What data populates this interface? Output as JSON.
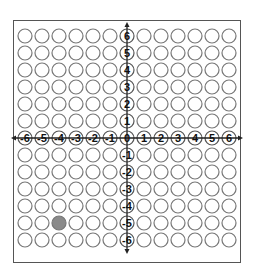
{
  "grid": {
    "x_min": -6,
    "x_max": 6,
    "y_min": -6,
    "y_max": 6,
    "origin_px": [
      127,
      138
    ],
    "spacing_px": 17,
    "circle_radius_px": 7,
    "circle_stroke": "#777777",
    "filled_color": "#8a8a8a",
    "axis_color": "#222222"
  },
  "x_axis_labels": [
    "-6",
    "-5",
    "-4",
    "-3",
    "-2",
    "-1",
    "0",
    "1",
    "2",
    "3",
    "4",
    "5",
    "6"
  ],
  "y_axis_labels": [
    "6",
    "5",
    "4",
    "3",
    "2",
    "1",
    "-1",
    "-2",
    "-3",
    "-4",
    "-5",
    "-6"
  ],
  "highlighted_points": [
    {
      "x": -4,
      "y": -5,
      "label": "filled-point"
    }
  ]
}
